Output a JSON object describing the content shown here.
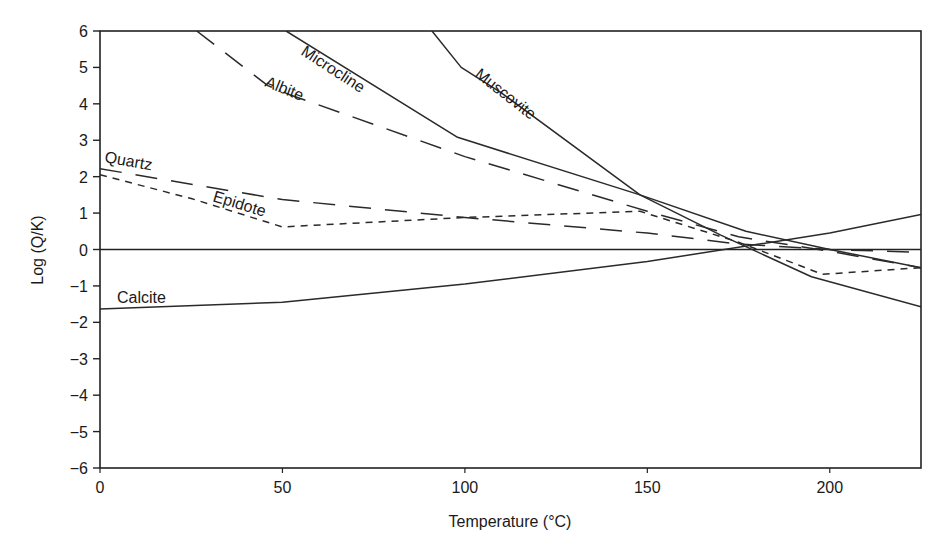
{
  "chart_data": {
    "type": "line",
    "title": "",
    "xlabel": "Temperature (°C)",
    "ylabel": "Log (Q/K)",
    "xlim": [
      0,
      225
    ],
    "ylim": [
      -6,
      6
    ],
    "x_ticks": [
      0,
      50,
      100,
      150,
      200
    ],
    "y_ticks": [
      6,
      5,
      4,
      3,
      2,
      1,
      0,
      -1,
      -2,
      -3,
      -4,
      -5,
      -6
    ],
    "y_tick_labels": [
      "6",
      "5",
      "4",
      "3",
      "2",
      "1",
      "0",
      "−1",
      "−2",
      "−3",
      "−4",
      "−5",
      "−6"
    ],
    "grid": false,
    "legend": "none (inline labels)",
    "reference_line": {
      "y": 0,
      "style": "solid"
    },
    "series": [
      {
        "name": "Microcline",
        "style": "solid",
        "points": [
          [
            51,
            6.0
          ],
          [
            98,
            3.08
          ],
          [
            148,
            1.5
          ],
          [
            177,
            0.5
          ],
          [
            200,
            0.0
          ],
          [
            225,
            -0.5
          ]
        ],
        "label_pos": [
          300,
          54
        ],
        "label_angle": 33
      },
      {
        "name": "Muscovite",
        "style": "solid",
        "points": [
          [
            91,
            6.0
          ],
          [
            99,
            5.0
          ],
          [
            110,
            4.3
          ],
          [
            148,
            1.5
          ],
          [
            170,
            0.4
          ],
          [
            195,
            -0.75
          ],
          [
            225,
            -1.57
          ]
        ],
        "label_pos": [
          474,
          76
        ],
        "label_angle": 38
      },
      {
        "name": "Albite",
        "style": "longdash",
        "points": [
          [
            26.5,
            6.0
          ],
          [
            46,
            4.5
          ],
          [
            52,
            4.25
          ],
          [
            100,
            2.55
          ],
          [
            150,
            1.05
          ],
          [
            175,
            0.35
          ],
          [
            200,
            -0.05
          ],
          [
            225,
            -0.5
          ]
        ],
        "label_pos": [
          264,
          86
        ],
        "label_angle": 22
      },
      {
        "name": "Quartz",
        "style": "longdash",
        "points": [
          [
            0,
            2.22
          ],
          [
            50,
            1.37
          ],
          [
            100,
            0.88
          ],
          [
            150,
            0.45
          ],
          [
            175,
            0.15
          ],
          [
            200,
            0.0
          ],
          [
            225,
            -0.08
          ]
        ],
        "label_pos": [
          104,
          162
        ],
        "label_angle": 10
      },
      {
        "name": "Epidote",
        "style": "shortdash",
        "points": [
          [
            0,
            2.05
          ],
          [
            25,
            1.4
          ],
          [
            50,
            0.62
          ],
          [
            100,
            0.88
          ],
          [
            148,
            1.05
          ],
          [
            175,
            0.2
          ],
          [
            198,
            -0.68
          ],
          [
            225,
            -0.5
          ]
        ],
        "label_pos": [
          212,
          201
        ],
        "label_angle": 17
      },
      {
        "name": "Calcite",
        "style": "solid",
        "points": [
          [
            0,
            -1.63
          ],
          [
            50,
            -1.45
          ],
          [
            100,
            -0.95
          ],
          [
            150,
            -0.33
          ],
          [
            200,
            0.45
          ],
          [
            225,
            0.96
          ]
        ],
        "label_pos": [
          117,
          303
        ],
        "label_angle": 0
      }
    ]
  },
  "axes": {
    "xlabel": "Temperature (°C)",
    "ylabel": "Log (Q/K)"
  }
}
